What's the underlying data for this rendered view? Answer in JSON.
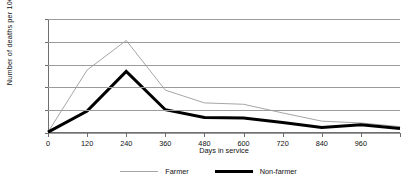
{
  "chart_data": {
    "type": "line",
    "title": "",
    "xlabel": "Days in service",
    "ylabel": "Number of deaths per 1000 men",
    "x": [
      0,
      120,
      240,
      360,
      480,
      600,
      720,
      840,
      960,
      1080
    ],
    "xlim": [
      0,
      1080
    ],
    "ylim": [
      0,
      25
    ],
    "xticks": [
      0,
      120,
      240,
      360,
      480,
      600,
      720,
      840,
      960,
      1080
    ],
    "xtick_labels": [
      "0",
      "120",
      "240",
      "360",
      "480",
      "600",
      "720",
      "840",
      "960",
      ""
    ],
    "yticks": [
      0,
      5,
      10,
      15,
      20,
      25
    ],
    "ytick_labels": [
      "0",
      "5",
      "10",
      "15",
      "20",
      "25"
    ],
    "grid": "horizontal",
    "legend_position": "bottom-center",
    "series": [
      {
        "name": "Farmer",
        "color": "#a6a6a6",
        "line_width": 1,
        "values": [
          0.2,
          13.8,
          20.3,
          9.4,
          6.6,
          6.3,
          4.4,
          2.6,
          2.2,
          1.4
        ]
      },
      {
        "name": "Non-farmer",
        "color": "#000000",
        "line_width": 3,
        "values": [
          0.2,
          4.8,
          13.5,
          5.1,
          3.4,
          3.3,
          2.3,
          1.2,
          1.8,
          1.0
        ]
      }
    ]
  },
  "legend": {
    "items": [
      {
        "label": "Farmer"
      },
      {
        "label": "Non-farmer"
      }
    ]
  }
}
